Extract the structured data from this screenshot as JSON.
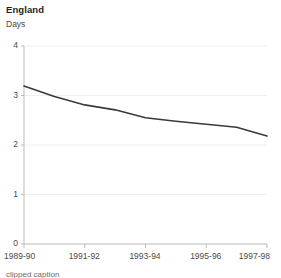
{
  "chart_data": {
    "type": "line",
    "title": "England",
    "subtitle": "",
    "ylabel": "Days",
    "xlabel": "",
    "ylim": [
      0,
      4
    ],
    "yticks": [
      0,
      1,
      2,
      3,
      4
    ],
    "ytick_labels": [
      "0",
      "1",
      "2",
      "3",
      "4"
    ],
    "grid": true,
    "grid_axis": "y",
    "legend": false,
    "categories": [
      "1989-90",
      "1990-91",
      "1991-92",
      "1992-93",
      "1993-94",
      "1994-95",
      "1995-96",
      "1996-97",
      "1997-98"
    ],
    "xtick_labels": [
      "1989-90",
      "1991-92",
      "1993-94",
      "1995-96",
      "1997-98"
    ],
    "xtick_indices": [
      0,
      2,
      4,
      6,
      8
    ],
    "series": [
      {
        "name": "England",
        "color": "#3a3a3a",
        "values": [
          3.19,
          2.98,
          2.81,
          2.71,
          2.55,
          2.48,
          2.42,
          2.36,
          2.18
        ]
      }
    ]
  },
  "style": {
    "line_color": "#3a3a3a",
    "grid_color": "#f0eeee",
    "axis_color": "#bdbabb",
    "text_color": "#4c4a4b",
    "title_color": "#231f20",
    "background": "#ffffff"
  },
  "caption": {
    "text": "clipped caption"
  }
}
